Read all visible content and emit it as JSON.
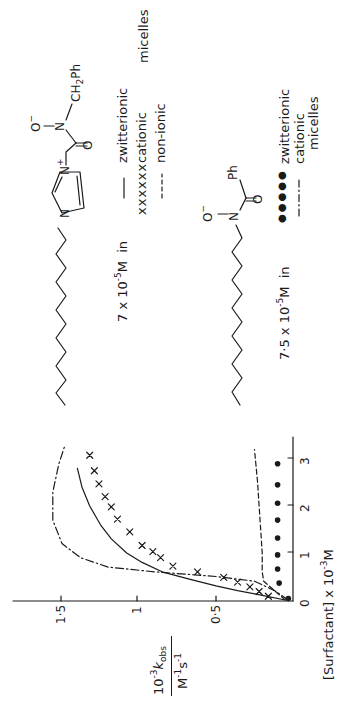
{
  "figure": {
    "orientation": "rotated 90 degrees counter-clockwise",
    "legend": {
      "group1": {
        "concentration_prefix": "7 x 10",
        "concentration_exp": "-5",
        "concentration_unit": "M",
        "in_word": "in",
        "entries": [
          {
            "marker": "solid line",
            "marker_text": "———",
            "label": "zwitterionic"
          },
          {
            "marker": "crosses",
            "marker_text": "xxxxxx",
            "label": "cationic"
          },
          {
            "marker": "dashed line",
            "marker_text": "-----",
            "label": "non-ionic"
          }
        ],
        "suffix": "micelles"
      },
      "group2": {
        "concentration_prefix": "7·5  x  10",
        "concentration_exp": "-5",
        "concentration_unit": "M",
        "in_word": "in",
        "entries": [
          {
            "marker": "filled circles",
            "marker_text": "●●●●●",
            "label": "zwitterionic"
          },
          {
            "marker": "dash-dot line",
            "marker_text": "—·—·—",
            "label": "cationic"
          }
        ],
        "suffix": "micelles"
      }
    },
    "molecule1": {
      "labels": {
        "n_plus": "N",
        "plus": "+",
        "n_ring": "N",
        "o_carbonyl": "O",
        "n_amide": "N",
        "o_minus": "O",
        "minus": "−",
        "ch2ph": "CH",
        "ch2ph_sub": "2",
        "ch2ph_tail": "Ph"
      }
    },
    "molecule2": {
      "labels": {
        "n_amide": "N",
        "o_minus": "O",
        "minus": "−",
        "o_carbonyl": "O",
        "ph": "Ph"
      }
    },
    "axes": {
      "x_label_prefix": "[Surfactant] x 10",
      "x_label_exp": "-3",
      "x_label_unit": "M",
      "y_label_num_prefix": "10",
      "y_label_num_exp": "-3",
      "y_label_num_k": "k",
      "y_label_num_sub": "obs",
      "y_label_den": "M",
      "y_label_den_exp1": "-1",
      "y_label_den_s": "s",
      "y_label_den_exp2": "-1",
      "x_ticks": [
        "0",
        "1",
        "2",
        "3"
      ],
      "y_ticks": [
        "0·5",
        "1",
        "1·5"
      ]
    }
  },
  "chart_data": {
    "type": "line",
    "title": "",
    "xlabel": "[Surfactant] x 10^-3 M",
    "ylabel": "10^-3 k_obs / M^-1 s^-1",
    "xlim": [
      0,
      3.4
    ],
    "ylim": [
      0,
      1.8
    ],
    "x_ticks": [
      0,
      1,
      2,
      3
    ],
    "y_ticks": [
      0.5,
      1,
      1.5
    ],
    "grid": false,
    "legend_position": "separate (right of molecule structures)",
    "series": [
      {
        "name": "7 x 10^-5 M imidazolium hydroxamate in zwitterionic micelles",
        "style": "solid line",
        "x": [
          0.0,
          0.1,
          0.2,
          0.3,
          0.45,
          0.6,
          0.8,
          1.0,
          1.3,
          1.6,
          2.0,
          2.4,
          2.8
        ],
        "y": [
          0.05,
          0.2,
          0.36,
          0.5,
          0.68,
          0.85,
          0.98,
          1.08,
          1.18,
          1.25,
          1.32,
          1.37,
          1.4
        ]
      },
      {
        "name": "7 x 10^-5 M imidazolium hydroxamate in cationic micelles",
        "style": "crosses",
        "x": [
          0.08,
          0.18,
          0.28,
          0.38,
          0.48,
          0.6,
          0.72,
          0.9,
          1.03,
          1.16,
          1.45,
          1.72,
          1.98,
          2.2,
          2.47,
          2.75,
          3.08
        ],
        "y": [
          0.16,
          0.22,
          0.28,
          0.36,
          0.45,
          0.62,
          0.78,
          0.86,
          0.91,
          0.98,
          1.06,
          1.14,
          1.18,
          1.22,
          1.26,
          1.29,
          1.32
        ]
      },
      {
        "name": "7 x 10^-5 M imidazolium hydroxamate in non-ionic micelles",
        "style": "dashed line",
        "x": [
          0.0,
          0.2,
          0.4,
          0.6,
          1.0,
          1.5,
          2.0,
          2.5,
          3.2
        ],
        "y": [
          0.05,
          0.12,
          0.19,
          0.2,
          0.2,
          0.21,
          0.22,
          0.23,
          0.25
        ]
      },
      {
        "name": "7.5 x 10^-5 M N-alkyl benzohydroxamate in zwitterionic micelles",
        "style": "filled circles",
        "x": [
          0.03,
          0.36,
          0.66,
          0.96,
          1.32,
          1.7,
          2.06,
          2.45,
          2.9
        ],
        "y": [
          0.03,
          0.09,
          0.1,
          0.1,
          0.1,
          0.1,
          0.1,
          0.1,
          0.1
        ]
      },
      {
        "name": "7.5 x 10^-5 M N-alkyl benzohydroxamate in cationic micelles",
        "style": "dash-dot line",
        "x": [
          0.0,
          0.2,
          0.4,
          0.5,
          0.6,
          0.7,
          0.9,
          1.2,
          1.7,
          2.3,
          2.9,
          3.3
        ],
        "y": [
          0.03,
          0.12,
          0.25,
          0.5,
          0.9,
          1.2,
          1.38,
          1.5,
          1.56,
          1.56,
          1.52,
          1.48
        ]
      }
    ]
  }
}
